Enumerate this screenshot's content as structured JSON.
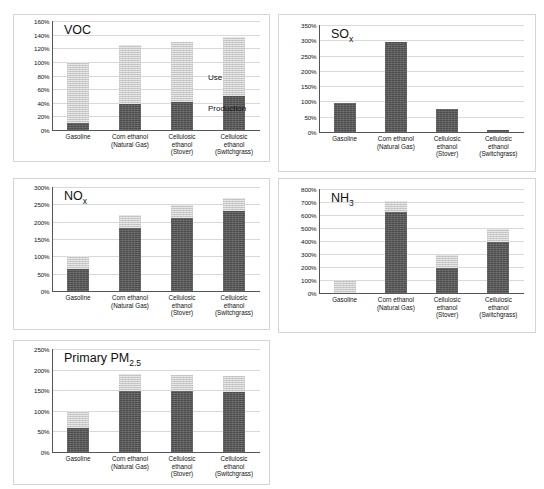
{
  "page": {
    "number": ""
  },
  "common": {
    "categories": [
      [
        "Gasoline"
      ],
      [
        "Corn ethanol",
        "(Natural Gas)"
      ],
      [
        "Cellulosic",
        "ethanol",
        "(Stover)"
      ],
      [
        "Cellulosic",
        "ethanol",
        "(Switchgrass)"
      ]
    ],
    "legend": {
      "use_label": "Use",
      "production_label": "Production"
    },
    "colors": {
      "use": "#c9c9c9",
      "production": "#4d4d4d",
      "grid": "#d9d9d9",
      "axis": "#555555",
      "panel_border": "#d4d4d4"
    }
  },
  "chart_data": [
    {
      "id": "voc",
      "type": "bar",
      "stacked": true,
      "title": "VOC",
      "title_sub": "",
      "xlabel": "",
      "ylabel": "",
      "ylim": [
        0,
        160
      ],
      "ytick_step": 20,
      "ytick_labels": [
        "0%",
        "20%",
        "40%",
        "60%",
        "80%",
        "100%",
        "120%",
        "140%",
        "160%"
      ],
      "grid": true,
      "legend": "inline-annotation",
      "categories": [
        "Gasoline",
        "Corn ethanol (Natural Gas)",
        "Cellulosic ethanol (Stover)",
        "Cellulosic ethanol (Switchgrass)"
      ],
      "series": [
        {
          "name": "Production",
          "values": [
            10,
            38,
            41,
            50
          ]
        },
        {
          "name": "Use",
          "values": [
            90,
            87,
            88,
            87
          ]
        }
      ],
      "totals": [
        100,
        125,
        129,
        137
      ],
      "annotations": [
        {
          "text": "Use",
          "x_category": "Cellulosic ethanol (Switchgrass)",
          "y": 75
        },
        {
          "text": "Production",
          "x_category": "Cellulosic ethanol (Switchgrass)",
          "y": 30
        }
      ]
    },
    {
      "id": "sox",
      "type": "bar",
      "stacked": true,
      "title": "SO",
      "title_sub": "x",
      "xlabel": "",
      "ylabel": "",
      "ylim": [
        0,
        350
      ],
      "ytick_step": 50,
      "ytick_labels": [
        "0%",
        "50%",
        "100%",
        "150%",
        "200%",
        "250%",
        "300%",
        "350%"
      ],
      "grid": true,
      "categories": [
        "Gasoline",
        "Corn ethanol (Natural Gas)",
        "Cellulosic ethanol (Stover)",
        "Cellulosic ethanol (Switchgrass)"
      ],
      "series": [
        {
          "name": "Production",
          "values": [
            95,
            293,
            76,
            7
          ]
        },
        {
          "name": "Use",
          "values": [
            0,
            0,
            0,
            0
          ]
        }
      ],
      "totals": [
        95,
        293,
        76,
        7
      ],
      "annotations": []
    },
    {
      "id": "nox",
      "type": "bar",
      "stacked": true,
      "title": "NO",
      "title_sub": "x",
      "xlabel": "",
      "ylabel": "",
      "ylim": [
        0,
        300
      ],
      "ytick_step": 50,
      "ytick_labels": [
        "0%",
        "50%",
        "100%",
        "150%",
        "200%",
        "250%",
        "300%"
      ],
      "grid": true,
      "categories": [
        "Gasoline",
        "Corn ethanol (Natural Gas)",
        "Cellulosic ethanol (Stover)",
        "Cellulosic ethanol (Switchgrass)"
      ],
      "series": [
        {
          "name": "Production",
          "values": [
            63,
            181,
            212,
            230
          ]
        },
        {
          "name": "Use",
          "values": [
            37,
            39,
            35,
            38
          ]
        }
      ],
      "totals": [
        100,
        220,
        247,
        268
      ],
      "annotations": []
    },
    {
      "id": "nh3",
      "type": "bar",
      "stacked": true,
      "title": "NH",
      "title_sub": "3",
      "xlabel": "",
      "ylabel": "",
      "ylim": [
        0,
        800
      ],
      "ytick_step": 100,
      "ytick_labels": [
        "0%",
        "100%",
        "200%",
        "300%",
        "400%",
        "500%",
        "600%",
        "700%",
        "800%"
      ],
      "grid": true,
      "categories": [
        "Gasoline",
        "Corn ethanol (Natural Gas)",
        "Cellulosic ethanol (Stover)",
        "Cellulosic ethanol (Switchgrass)"
      ],
      "series": [
        {
          "name": "Production",
          "values": [
            0,
            625,
            190,
            395
          ]
        },
        {
          "name": "Use",
          "values": [
            95,
            85,
            102,
            97
          ]
        }
      ],
      "totals": [
        95,
        710,
        292,
        492
      ],
      "annotations": []
    },
    {
      "id": "pm25",
      "type": "bar",
      "stacked": true,
      "title": "Primary PM",
      "title_sub": "2.5",
      "xlabel": "",
      "ylabel": "",
      "ylim": [
        0,
        250
      ],
      "ytick_step": 50,
      "ytick_labels": [
        "0%",
        "50%",
        "100%",
        "150%",
        "200%",
        "250%"
      ],
      "grid": true,
      "categories": [
        "Gasoline",
        "Corn ethanol (Natural Gas)",
        "Cellulosic ethanol (Stover)",
        "Cellulosic ethanol (Switchgrass)"
      ],
      "series": [
        {
          "name": "Production",
          "values": [
            59,
            148,
            147,
            145
          ]
        },
        {
          "name": "Use",
          "values": [
            41,
            42,
            41,
            40
          ]
        }
      ],
      "totals": [
        100,
        190,
        188,
        185
      ],
      "annotations": []
    }
  ],
  "layout": {
    "panels": [
      {
        "id": "voc",
        "left": 13,
        "top": 14,
        "width": 257,
        "height": 148,
        "plot_left": 38,
        "plot_top": 6,
        "plot_width": 208,
        "plot_height": 109
      },
      {
        "id": "sox",
        "left": 278,
        "top": 14,
        "width": 258,
        "height": 158,
        "plot_left": 40,
        "plot_top": 10,
        "plot_width": 205,
        "plot_height": 107
      },
      {
        "id": "nox",
        "left": 13,
        "top": 178,
        "width": 257,
        "height": 152,
        "plot_left": 38,
        "plot_top": 8,
        "plot_width": 208,
        "plot_height": 104
      },
      {
        "id": "nh3",
        "left": 278,
        "top": 178,
        "width": 258,
        "height": 155,
        "plot_left": 40,
        "plot_top": 10,
        "plot_width": 205,
        "plot_height": 104
      },
      {
        "id": "pm25",
        "left": 13,
        "top": 340,
        "width": 257,
        "height": 145,
        "plot_left": 38,
        "plot_top": 8,
        "plot_width": 208,
        "plot_height": 103
      }
    ]
  }
}
